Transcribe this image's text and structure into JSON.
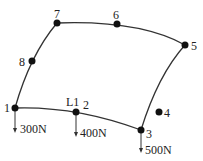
{
  "diagram": {
    "type": "curved-quadrilateral finite element with loads",
    "nodes": [
      {
        "id": "1",
        "label": "1",
        "x": 15,
        "y": 108
      },
      {
        "id": "2",
        "label": "2",
        "x": 76,
        "y": 112
      },
      {
        "id": "3",
        "label": "3",
        "x": 141,
        "y": 130
      },
      {
        "id": "4",
        "label": "4",
        "x": 159,
        "y": 112
      },
      {
        "id": "5",
        "label": "5",
        "x": 185,
        "y": 45
      },
      {
        "id": "6",
        "label": "6",
        "x": 117,
        "y": 24
      },
      {
        "id": "7",
        "label": "7",
        "x": 57,
        "y": 23
      },
      {
        "id": "8",
        "label": "8",
        "x": 32,
        "y": 61
      }
    ],
    "edge_label": "L1",
    "loads": [
      {
        "node": "1",
        "value": "300N"
      },
      {
        "node": "2",
        "value": "400N"
      },
      {
        "node": "3",
        "value": "500N"
      }
    ]
  }
}
